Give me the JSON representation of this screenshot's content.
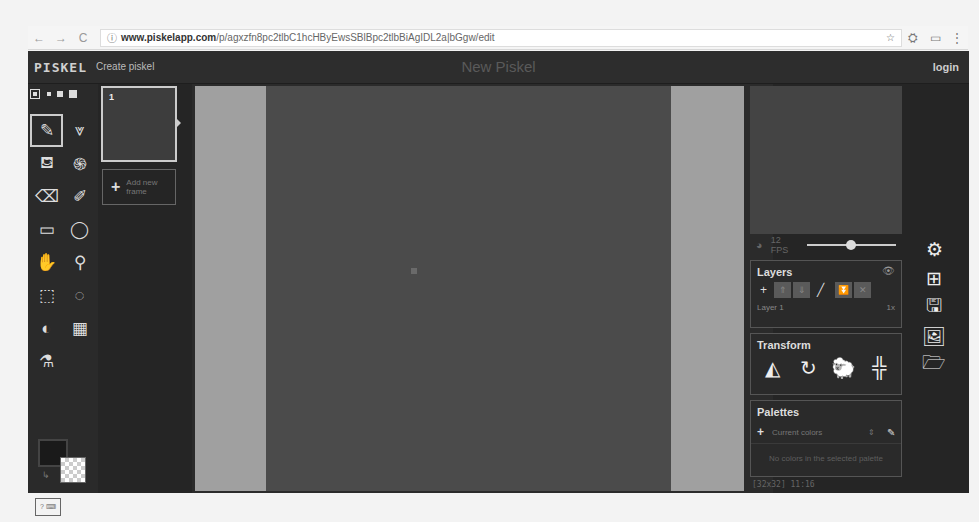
{
  "browser": {
    "back_icon": "←",
    "forward_icon": "→",
    "reload_icon": "C",
    "secure_icon": "ⓘ",
    "url_host": "www.piskelapp.com",
    "url_path": "/p/agxzfn8pc2tlbC1hcHByEwsSBlBpc2tlbBiAgIDL2a|bGgw/edit",
    "star_icon": "☆",
    "ext_icon": "⛭",
    "cast_icon": "▭",
    "menu_icon": "⋮"
  },
  "header": {
    "logo": "PISKEL",
    "create_link": "Create piskel",
    "piskel_name": "New Piskel",
    "login": "login"
  },
  "tools": {
    "pen_sizes": [
      1,
      2,
      3,
      4
    ],
    "selected_pen_size": 1,
    "items": [
      {
        "name": "pen-tool",
        "glyph": "✎",
        "selected": true
      },
      {
        "name": "vertical-mirror-pen-tool",
        "glyph": "⩔"
      },
      {
        "name": "paint-bucket-tool",
        "glyph": "⛾"
      },
      {
        "name": "paint-same-color-tool",
        "glyph": "֍"
      },
      {
        "name": "eraser-tool",
        "glyph": "⌫"
      },
      {
        "name": "stroke-tool",
        "glyph": "✐"
      },
      {
        "name": "rectangle-tool",
        "glyph": "▭"
      },
      {
        "name": "circle-tool",
        "glyph": "◯"
      },
      {
        "name": "move-tool",
        "glyph": "✋"
      },
      {
        "name": "shape-selection-tool",
        "glyph": "⚲"
      },
      {
        "name": "rectangle-selection-tool",
        "glyph": "⬚"
      },
      {
        "name": "lasso-selection-tool",
        "glyph": "◌"
      },
      {
        "name": "lighten-tool",
        "glyph": "◐"
      },
      {
        "name": "dithering-tool",
        "glyph": "▦"
      },
      {
        "name": "color-picker-tool",
        "glyph": "⚗"
      }
    ],
    "primary_color": "#1a1a1a",
    "secondary_color": "transparent",
    "swap_icon": "↳",
    "shortcuts_label": "? ⌨"
  },
  "frames": {
    "items": [
      {
        "number": "1"
      }
    ],
    "add_frame_label": "Add new frame",
    "add_icon": "+"
  },
  "preview": {
    "onion_icon": "◕",
    "fps_label": "12 FPS",
    "fps_value": 12,
    "fps_max": 24
  },
  "layers": {
    "title": "Layers",
    "eye_icon": "👁",
    "buttons": {
      "add": "+",
      "up": "⇑",
      "down": "⇓",
      "edit": "╱",
      "merge": "⏬",
      "delete": "✕"
    },
    "items": [
      {
        "name": "Layer 1",
        "opacity": "1x"
      }
    ]
  },
  "transform": {
    "title": "Transform",
    "tools": [
      {
        "name": "flip-tool",
        "glyph": "◭"
      },
      {
        "name": "rotate-tool",
        "glyph": "↻"
      },
      {
        "name": "clone-tool",
        "glyph": "🐑"
      },
      {
        "name": "center-tool",
        "glyph": "╬"
      }
    ]
  },
  "palettes": {
    "title": "Palettes",
    "add_icon": "+",
    "selected": "Current colors",
    "dropdown_icon": "⇕",
    "edit_icon": "✎",
    "empty_message": "No colors in the selected palette"
  },
  "status": {
    "cursor_coords": "[32x32] 11:16"
  },
  "settings": {
    "items": [
      {
        "name": "settings-icon",
        "glyph": "⚙"
      },
      {
        "name": "resize-icon",
        "glyph": "⊞"
      },
      {
        "name": "save-icon",
        "glyph": "🖫"
      },
      {
        "name": "export-icon",
        "glyph": "🖼"
      },
      {
        "name": "import-icon",
        "glyph": "🗁"
      }
    ]
  },
  "colors": {
    "app_bg": "#252525",
    "canvas_bg": "#a0a0a0",
    "canvas": "#4b4b4b"
  }
}
